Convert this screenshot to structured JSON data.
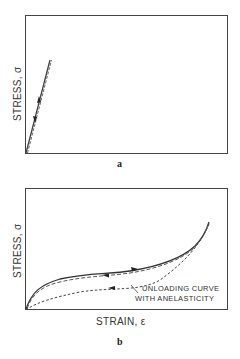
{
  "figure": {
    "panels": [
      {
        "id": "a",
        "label": "a",
        "ylabel": "STRESS, σ",
        "xlabel": "",
        "description": "Linear elastic loading and unloading; loading (solid) and unloading (dashed) coincide along a steep straight line",
        "curves": [
          {
            "name": "loading",
            "style": "solid",
            "arrow": "up"
          },
          {
            "name": "unloading",
            "style": "dashed",
            "arrow": "down"
          }
        ]
      },
      {
        "id": "b",
        "label": "b",
        "ylabel": "STRESS, σ",
        "xlabel": "STRAIN, ε",
        "annotation_line1": "UNLOADING CURVE",
        "annotation_line2": "WITH ANELASTICITY",
        "description": "Nonlinear elastic loading (solid) and unloading (dashed) coincide; unloading with anelasticity (short dashed) follows a lower path forming a hysteresis loop",
        "curves": [
          {
            "name": "loading",
            "style": "solid",
            "arrow": "right"
          },
          {
            "name": "unloading",
            "style": "dashed",
            "arrow": "left"
          },
          {
            "name": "unloading-anelastic",
            "style": "short-dashed",
            "arrow": "left"
          }
        ]
      }
    ]
  },
  "colors": {
    "line": "#333333",
    "frame": "#444444",
    "background": "#ffffff"
  }
}
